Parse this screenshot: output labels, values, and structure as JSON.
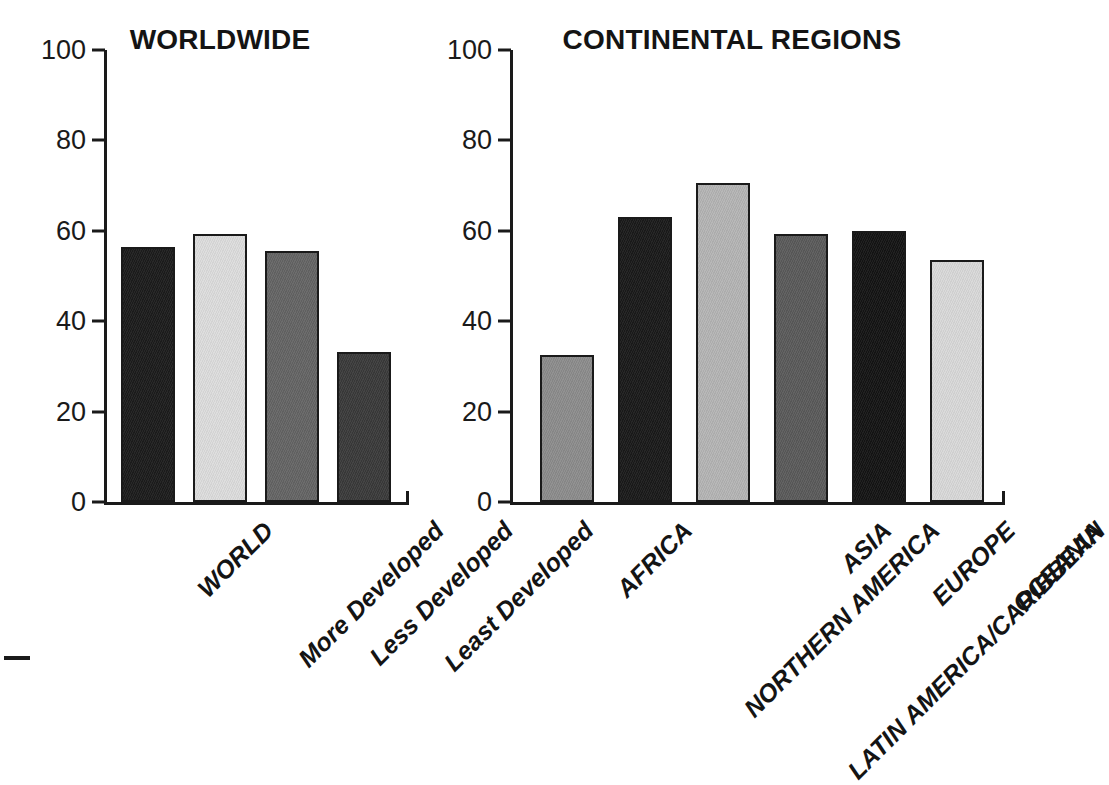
{
  "figure": {
    "background_color": "#ffffff",
    "text_color": "#141414",
    "axis_color": "#1a1a1a",
    "edge_dash_mark": "—"
  },
  "chart_data": [
    {
      "type": "bar",
      "title": "WORLDWIDE",
      "xlabel": "",
      "ylabel": "",
      "ylim": [
        0,
        100
      ],
      "yticks": [
        0,
        20,
        40,
        60,
        80,
        100
      ],
      "ytick_labels": [
        "0",
        "20",
        "40",
        "60",
        "80",
        "100"
      ],
      "grid": false,
      "legend": "none",
      "categories": [
        "WORLD",
        "More Developed",
        "Less Developed",
        "Least Developed"
      ],
      "values": [
        56.5,
        59.3,
        55.5,
        33.2
      ],
      "bar_colors": [
        "#1c1c1c",
        "#dcdcdc",
        "#646464",
        "#3a3a3a"
      ]
    },
    {
      "type": "bar",
      "title": "CONTINENTAL REGIONS",
      "xlabel": "",
      "ylabel": "",
      "ylim": [
        0,
        100
      ],
      "yticks": [
        0,
        20,
        40,
        60,
        80,
        100
      ],
      "ytick_labels": [
        "0",
        "20",
        "40",
        "60",
        "80",
        "100"
      ],
      "grid": false,
      "legend": "none",
      "categories": [
        "AFRICA",
        "NORTHERN AMERICA",
        "LATIN AMERICA/CARIBBEAN",
        "ASIA",
        "EUROPE",
        "OCEANIA"
      ],
      "values": [
        32.5,
        63.0,
        70.5,
        59.3,
        60.0,
        53.5
      ],
      "bar_colors": [
        "#8c8c8c",
        "#1a1a1a",
        "#b4b4b4",
        "#5a5a5a",
        "#141414",
        "#d8d8d8"
      ]
    }
  ]
}
